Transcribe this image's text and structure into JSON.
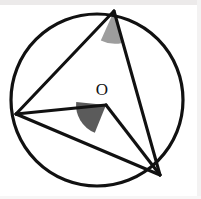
{
  "figure": {
    "canvas": {
      "width": 201,
      "height": 199,
      "background": "#ffffff"
    },
    "colors": {
      "stroke": "#111111",
      "inscribed_angle_fill": "#9d9d9d",
      "central_angle_fill": "#5b5b5b",
      "label_color": "#121212",
      "edge_band": "#eceaea"
    },
    "circle": {
      "name": "circle",
      "cx": 97,
      "cy": 100,
      "r": 86,
      "stroke_width": 3.2
    },
    "center_label": {
      "text": "O",
      "x": 102,
      "y": 95
    },
    "points": [
      {
        "id": "A",
        "role": "top-vertex",
        "x": 114,
        "y": 11
      },
      {
        "id": "B",
        "role": "left-vertex",
        "x": 16,
        "y": 114
      },
      {
        "id": "C",
        "role": "bottom-right-vertex",
        "x": 160,
        "y": 175
      },
      {
        "id": "O",
        "role": "center",
        "x": 106,
        "y": 105
      }
    ],
    "segments": [
      {
        "name": "chord-A-B",
        "from": "A",
        "to": "B",
        "x1": 114,
        "y1": 11,
        "x2": 16,
        "y2": 114,
        "width": 3.1
      },
      {
        "name": "chord-A-C",
        "from": "A",
        "to": "C",
        "x1": 114,
        "y1": 11,
        "x2": 160,
        "y2": 175,
        "width": 3.1
      },
      {
        "name": "chord-B-C",
        "from": "B",
        "to": "C",
        "x1": 16,
        "y1": 114,
        "x2": 160,
        "y2": 175,
        "width": 3.1
      },
      {
        "name": "radius-O-B",
        "from": "O",
        "to": "B",
        "x1": 106,
        "y1": 105,
        "x2": 16,
        "y2": 114,
        "width": 3.1
      },
      {
        "name": "radius-O-C",
        "from": "O",
        "to": "C",
        "x1": 106,
        "y1": 105,
        "x2": 160,
        "y2": 175,
        "width": 3.1
      }
    ],
    "angle_markers": [
      {
        "name": "inscribed-angle-at-A",
        "vertex": "A",
        "fill": "#9d9d9d",
        "path": "M 114 11 L 100.8 40.4 A 32 32 0 0 0 122.2 42.9 Z"
      },
      {
        "name": "central-angle-at-O",
        "vertex": "O",
        "fill": "#5b5b5b",
        "path": "M 106 105 L 76.2 102.0 A 30 30 0 0 0 94.8 132.7 Z"
      }
    ]
  }
}
